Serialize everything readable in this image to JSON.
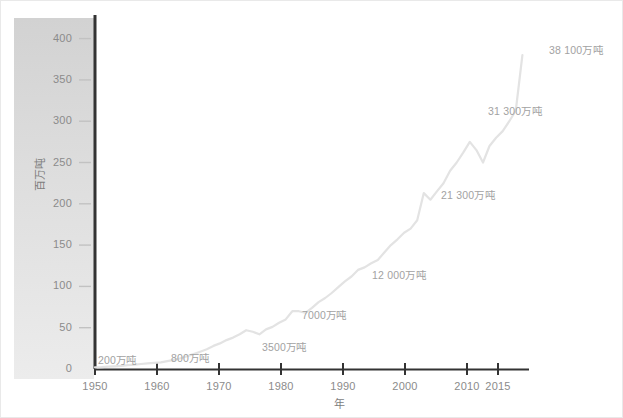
{
  "chart_data": {
    "type": "line",
    "title": "",
    "subtitle": "",
    "xlabel": "年",
    "ylabel": "百万吨",
    "xlim": [
      1950,
      2016
    ],
    "ylim": [
      0,
      420
    ],
    "grid": false,
    "legend": "none",
    "xticks": [
      "1950",
      "1960",
      "1970",
      "1980",
      "1990",
      "2000",
      "2010",
      "2015"
    ],
    "xtick_values": [
      1950,
      1960,
      1970,
      1980,
      1990,
      2000,
      2010,
      2015
    ],
    "yticks": [
      "0",
      "50",
      "100",
      "150",
      "200",
      "250",
      "300",
      "350",
      "400"
    ],
    "ytick_values": [
      0,
      50,
      100,
      150,
      200,
      250,
      300,
      350,
      400
    ],
    "series": [
      {
        "name": "全球塑料产量",
        "color": "#e3e3e3",
        "x": [
          1950,
          1951,
          1952,
          1953,
          1954,
          1955,
          1956,
          1957,
          1958,
          1959,
          1960,
          1961,
          1962,
          1963,
          1964,
          1965,
          1966,
          1967,
          1968,
          1969,
          1970,
          1971,
          1972,
          1973,
          1974,
          1975,
          1976,
          1977,
          1978,
          1979,
          1980,
          1981,
          1982,
          1983,
          1984,
          1985,
          1986,
          1987,
          1988,
          1989,
          1990,
          1991,
          1992,
          1993,
          1994,
          1995,
          1996,
          1997,
          1998,
          1999,
          2000,
          2001,
          2002,
          2003,
          2004,
          2005,
          2006,
          2007,
          2008,
          2009,
          2010,
          2011,
          2012,
          2013,
          2014,
          2015
        ],
        "values": [
          2,
          2.3,
          2.8,
          3.3,
          3.9,
          4.6,
          5.3,
          6.1,
          6.8,
          7.4,
          8,
          9.5,
          11,
          13,
          15.5,
          18,
          21,
          24,
          28,
          31,
          35,
          38,
          42,
          47,
          45,
          42,
          48,
          51,
          56,
          60,
          70,
          70,
          68,
          74,
          81,
          86,
          92,
          99,
          106,
          112,
          120,
          123,
          128,
          132,
          141,
          150,
          157,
          165,
          170,
          180,
          213,
          205,
          215,
          225,
          240,
          250,
          262,
          275,
          265,
          250,
          270,
          280,
          288,
          300,
          313,
          380
        ],
        "unit": "百万吨"
      }
    ],
    "annotations": [
      {
        "text": "200万吨",
        "year": 1950,
        "value": 2,
        "tons_wan": 200,
        "x": 97,
        "y": 357
      },
      {
        "text": "800万吨",
        "year": 1960,
        "value": 8,
        "tons_wan": 800,
        "x": 170,
        "y": 355
      },
      {
        "text": "3500万吨",
        "year": 1970,
        "value": 35,
        "tons_wan": 3500,
        "x": 261,
        "y": 344
      },
      {
        "text": "7000万吨",
        "year": 1980,
        "value": 70,
        "tons_wan": 7000,
        "x": 301,
        "y": 312
      },
      {
        "text": "12 000万吨",
        "year": 1990,
        "value": 120,
        "tons_wan": 12000,
        "x": 371,
        "y": 272
      },
      {
        "text": "21 300万吨",
        "year": 2000,
        "value": 213,
        "tons_wan": 21300,
        "x": 440,
        "y": 192
      },
      {
        "text": "31 300万吨",
        "year": 2010,
        "value": 313,
        "tons_wan": 31300,
        "x": 487,
        "y": 108
      },
      {
        "text": "38 100万吨",
        "year": 2015,
        "value": 381,
        "tons_wan": 38100,
        "x": 548,
        "y": 47
      }
    ],
    "colors": {
      "line": "#e4e4e4",
      "axis": "#3a3a3a",
      "tick_text": "#8b8b8b",
      "annotation_text": "#a3a3a3",
      "band_top": "#d3d3d3",
      "band_bottom": "#ebebeb"
    }
  }
}
